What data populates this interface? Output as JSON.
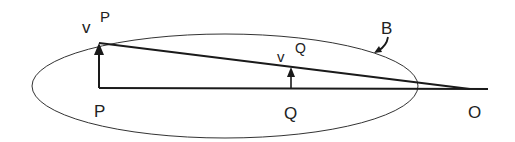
{
  "diagram": {
    "type": "velocity-diagram",
    "colors": {
      "stroke": "#1a1a1a",
      "ellipse": "#333333",
      "background": "#ffffff"
    },
    "labels": {
      "point_p": "P",
      "point_q": "Q",
      "point_o": "O",
      "body": "B",
      "velocity_p_symbol": "v",
      "velocity_p_sup": "P",
      "velocity_q_symbol": "v",
      "velocity_q_sup": "Q"
    },
    "elements": {
      "body_ellipse": "Rigid body B (ellipse)",
      "baseline": "Line P–Q–O",
      "velocity_p_arrow": "Velocity vector at P",
      "velocity_q_arrow": "Velocity vector at Q",
      "tip_line": "Line through velocity tips to O"
    }
  }
}
